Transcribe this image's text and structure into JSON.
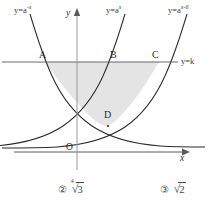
{
  "figure": {
    "curves": [
      {
        "id": "curve-left",
        "label_base": "y=a",
        "label_exp": "-x",
        "label_full": "y=a^{-x}"
      },
      {
        "id": "curve-mid",
        "label_base": "y=a",
        "label_exp": "x",
        "label_full": "y=a^{x}"
      },
      {
        "id": "curve-right",
        "label_base": "y=a",
        "label_exp": "x-6",
        "label_full": "y=a^{x-6}"
      }
    ],
    "horizontal_line": {
      "label_base": "y=k",
      "value": "k"
    },
    "points": [
      {
        "name": "A",
        "x": 45,
        "y": 62
      },
      {
        "name": "B",
        "x": 113,
        "y": 62
      },
      {
        "name": "C",
        "x": 159,
        "y": 62
      },
      {
        "name": "D",
        "x": 108,
        "y": 126
      }
    ],
    "axes": {
      "origin_label": "O",
      "x_label": "x",
      "y_label": "y"
    },
    "shaded_region": {
      "fill": "#e3e3e3",
      "description": "region bounded by A,B,C and D"
    }
  },
  "options": [
    {
      "number": "②",
      "degree": "4",
      "radicand": "3"
    },
    {
      "number": "③",
      "degree": "",
      "radicand": "2"
    }
  ],
  "colors": {
    "curve": "#2b2b2b",
    "axis": "#5a5a5a",
    "shade": "#e3e3e3",
    "text": "#3a3a3a"
  }
}
